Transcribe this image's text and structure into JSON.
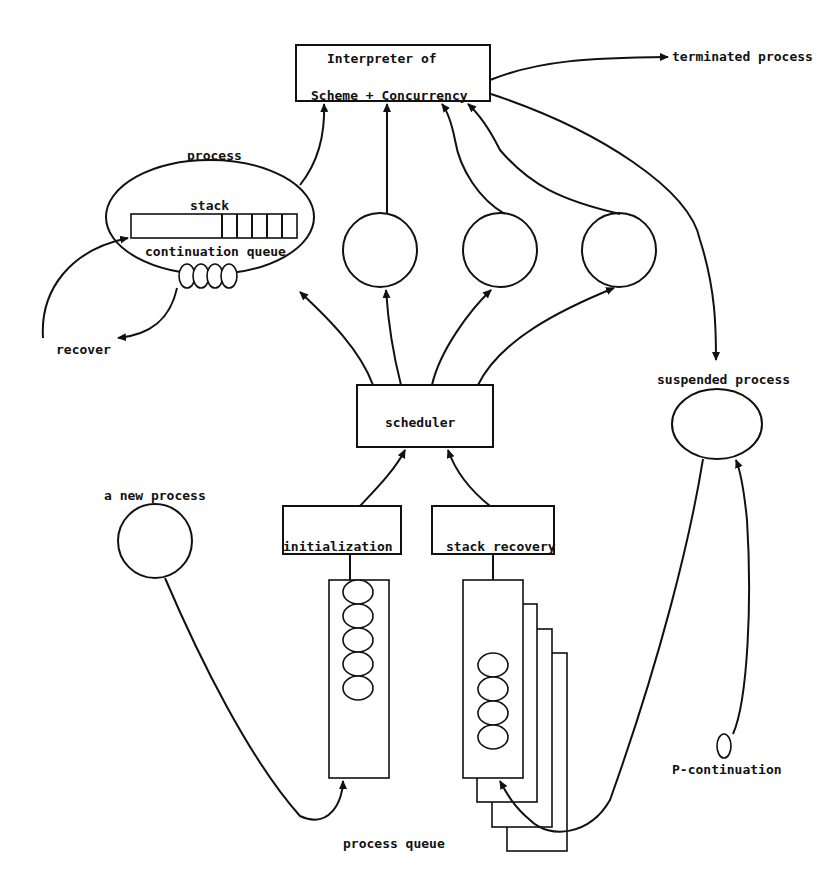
{
  "diagram": {
    "interpreter": {
      "line1": "Interpreter of",
      "line2": "Scheme + Concurrency"
    },
    "labels": {
      "terminated_process": "terminated process",
      "process": "process",
      "stack": "stack",
      "continuation_queue": "continuation queue",
      "recover": "recover",
      "scheduler": "scheduler",
      "suspended_process": "suspended process",
      "a_new_process": "a new process",
      "initialization": "initialization",
      "stack_recovery": "stack recovery",
      "p_continuation": "P-continuation",
      "process_queue": "process queue"
    },
    "counts": {
      "stack_cells": 5,
      "continuation_queue_items": 4,
      "active_process_circles": 3,
      "initialization_queue_items": 5,
      "stack_recovery_queue_items": 4,
      "stack_recovery_layers": 4
    },
    "colors": {
      "stroke": "#111111",
      "background": "#ffffff"
    }
  }
}
